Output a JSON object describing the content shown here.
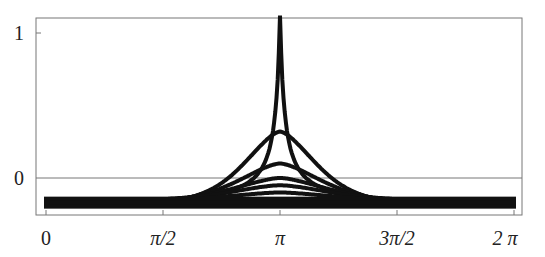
{
  "chart_data": {
    "type": "line",
    "title": "",
    "xlabel": "",
    "ylabel": "",
    "x_ticks": [
      "0",
      "π/2",
      "π",
      "3π/2",
      "2 π"
    ],
    "y_ticks": [
      "0",
      "1"
    ],
    "xlim": [
      0,
      6.2832
    ],
    "ylim": [
      -0.25,
      1.1
    ],
    "grid": false,
    "legend": null,
    "baseline": -0.17,
    "series": [
      {
        "name": "curve-1",
        "peak_at_pi": 1.1,
        "note": "cusp, exceeds top of plot"
      },
      {
        "name": "curve-2",
        "peak_at_pi": 0.32
      },
      {
        "name": "curve-3",
        "peak_at_pi": 0.1
      },
      {
        "name": "curve-4",
        "peak_at_pi": 0.0
      },
      {
        "name": "curve-5",
        "peak_at_pi": -0.05
      },
      {
        "name": "curve-6",
        "peak_at_pi": -0.1
      }
    ]
  },
  "labels": {
    "y1": "1",
    "y0": "0",
    "x0": "0",
    "x1": "π/2",
    "x2": "π",
    "x3": "3π/2",
    "x4": "2 π"
  }
}
